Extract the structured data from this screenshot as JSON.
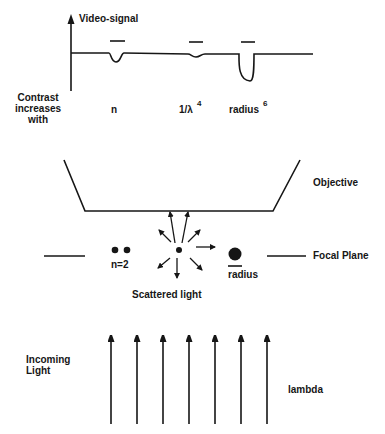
{
  "graph": {
    "y_axis_label": "Video-signal",
    "row_label": [
      "Contrast",
      "increases",
      "with"
    ],
    "factors": [
      {
        "base": "n",
        "exponent": ""
      },
      {
        "base": "1/λ",
        "exponent": "4"
      },
      {
        "base": "radius",
        "exponent": "6"
      }
    ]
  },
  "optics": {
    "objective_label": "Objective",
    "focal_plane_label": "Focal Plane",
    "particle_pair_label": "n=2",
    "large_particle_label": "radius",
    "scatter_label": "Scattered light"
  },
  "illumination": {
    "incoming_label": [
      "Incoming",
      "Light"
    ],
    "wavelength_label": "lambda",
    "arrow_count": 7
  },
  "colors": {
    "ink": "#161616",
    "background": "#ffffff"
  }
}
